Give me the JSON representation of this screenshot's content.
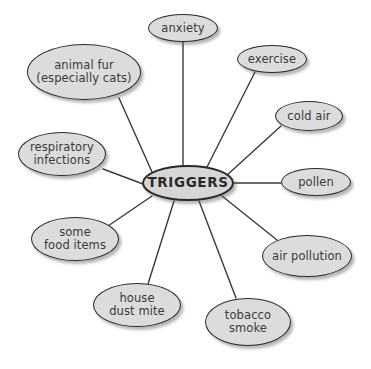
{
  "diagram": {
    "type": "mind-map",
    "colors": {
      "node_fill": "#dcdcdc",
      "node_stroke": "#2b2b2b",
      "text": "#3a3a3a",
      "connector": "#3a3a3a",
      "background": "#ffffff"
    },
    "center": {
      "id": "triggers",
      "label": "TRIGGERS",
      "x": 188,
      "y": 183,
      "rx": 46,
      "ry": 18,
      "font_size": 13.5
    },
    "nodes": [
      {
        "id": "anxiety",
        "label": "anxiety",
        "x": 183,
        "y": 28,
        "rx": 35,
        "ry": 14,
        "font_size": 11.5
      },
      {
        "id": "exercise",
        "label": "exercise",
        "x": 272,
        "y": 59,
        "rx": 35,
        "ry": 14,
        "font_size": 11.5
      },
      {
        "id": "cold-air",
        "label": "cold air",
        "x": 309,
        "y": 116,
        "rx": 34,
        "ry": 15,
        "font_size": 11.5
      },
      {
        "id": "pollen",
        "label": "pollen",
        "x": 316,
        "y": 182,
        "rx": 35,
        "ry": 14,
        "font_size": 11.5
      },
      {
        "id": "air-pollution",
        "label": "air pollution",
        "x": 307,
        "y": 256,
        "rx": 45,
        "ry": 21,
        "font_size": 11.5
      },
      {
        "id": "tobacco-smoke",
        "label": "tobacco\nsmoke",
        "x": 248,
        "y": 322,
        "rx": 43,
        "ry": 24,
        "font_size": 11.5
      },
      {
        "id": "house-dust-mite",
        "label": "house\ndust mite",
        "x": 137,
        "y": 305,
        "rx": 44,
        "ry": 22,
        "font_size": 11.5
      },
      {
        "id": "some-food-items",
        "label": "some\nfood items",
        "x": 75,
        "y": 239,
        "rx": 44,
        "ry": 22,
        "font_size": 11.5
      },
      {
        "id": "respiratory-infections",
        "label": "respiratory\ninfections",
        "x": 62,
        "y": 154,
        "rx": 44,
        "ry": 22,
        "font_size": 11.5
      },
      {
        "id": "animal-fur",
        "label": "animal fur\n(especially cats)",
        "x": 84,
        "y": 72,
        "rx": 57,
        "ry": 28,
        "font_size": 11.5
      }
    ],
    "connectors": [
      {
        "id": "link-anxiety",
        "from": "triggers",
        "to": "anxiety",
        "x1": 183,
        "y1": 166,
        "x2": 183,
        "y2": 42
      },
      {
        "id": "link-exercise",
        "from": "triggers",
        "to": "exercise",
        "x1": 206,
        "y1": 169,
        "x2": 255,
        "y2": 72
      },
      {
        "id": "link-cold-air",
        "from": "triggers",
        "to": "cold-air",
        "x1": 226,
        "y1": 176,
        "x2": 281,
        "y2": 126
      },
      {
        "id": "link-pollen",
        "from": "triggers",
        "to": "pollen",
        "x1": 234,
        "y1": 183,
        "x2": 281,
        "y2": 183
      },
      {
        "id": "link-air-pollution",
        "from": "triggers",
        "to": "air-pollution",
        "x1": 222,
        "y1": 196,
        "x2": 277,
        "y2": 240
      },
      {
        "id": "link-tobacco-smoke",
        "from": "triggers",
        "to": "tobacco-smoke",
        "x1": 199,
        "y1": 201,
        "x2": 236,
        "y2": 298
      },
      {
        "id": "link-house-dust-mite",
        "from": "triggers",
        "to": "house-dust-mite",
        "x1": 174,
        "y1": 201,
        "x2": 148,
        "y2": 284
      },
      {
        "id": "link-some-food-items",
        "from": "triggers",
        "to": "some-food-items",
        "x1": 152,
        "y1": 196,
        "x2": 108,
        "y2": 226
      },
      {
        "id": "link-respiratory",
        "from": "triggers",
        "to": "respiratory-infections",
        "x1": 143,
        "y1": 184,
        "x2": 103,
        "y2": 169
      },
      {
        "id": "link-animal-fur",
        "from": "triggers",
        "to": "animal-fur",
        "x1": 152,
        "y1": 172,
        "x2": 119,
        "y2": 98
      }
    ]
  }
}
